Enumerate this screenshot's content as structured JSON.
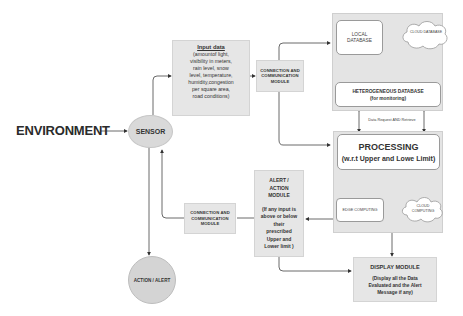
{
  "environment": {
    "label": "ENVIRONMENT"
  },
  "sensor": {
    "label": "SENSOR"
  },
  "action_alert": {
    "label": "ACTION / ALERT"
  },
  "input_data": {
    "title": "Input data",
    "lines": [
      "(amountof light,",
      "visibility in meters,",
      "rain level, snow",
      "level, temperature,",
      "humidity,congestion",
      "per square area,",
      "road conditions)"
    ]
  },
  "conn_module_top": {
    "lines": [
      "CONNECTION AND",
      "COMMUNICATION",
      "MODULE"
    ]
  },
  "conn_module_bottom": {
    "lines": [
      "CONNECTION AND",
      "COMMUNICATION",
      "MODULE"
    ]
  },
  "storage": {
    "local_db": {
      "lines": [
        "LOCAL",
        "DATABASE"
      ]
    },
    "cloud_db": {
      "label": "CLOUD DATABASE"
    },
    "hetero_db": {
      "title": "HETEROGENEOUS DATABASE",
      "subtitle": "(for monitoring)"
    }
  },
  "data_link_label": "Data Request AND Retrieve",
  "processing": {
    "title": "PROCESSING",
    "subtitle": "(w.r.t Upper and Lowe Limit)",
    "edge": {
      "label": "EDGE COMPUTING"
    },
    "cloud": {
      "lines": [
        "CLOUD",
        "COMPUTING"
      ]
    }
  },
  "alert_module": {
    "title_lines": [
      "ALERT /",
      "ACTION",
      "MODULE"
    ],
    "desc_lines": [
      "(If any input is",
      "above or below",
      "their",
      "prescribed",
      "Upper and",
      "Lower limit )"
    ]
  },
  "display_module": {
    "title": "DISPLAY MODULE",
    "desc_lines": [
      "(Display all the Data",
      "Evaluated and the Alert",
      "Message if any)"
    ]
  }
}
